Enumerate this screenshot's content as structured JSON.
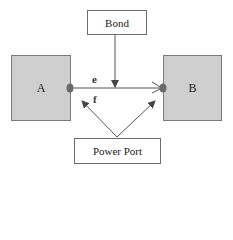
{
  "diagram": {
    "bond": {
      "label": "Bond"
    },
    "block_a": {
      "label": "A"
    },
    "block_b": {
      "label": "B"
    },
    "effort": {
      "label": "e"
    },
    "flow": {
      "label": "f"
    },
    "power_port": {
      "label": "Power Port"
    },
    "colors": {
      "block_fill": "#cfcfcf",
      "border": "#6e6e6e",
      "port_dot": "#6a6a6a",
      "line": "#555555"
    }
  }
}
